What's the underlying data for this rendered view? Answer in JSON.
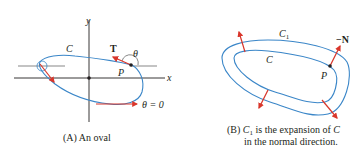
{
  "colors": {
    "curve": "#3a86c8",
    "arrow": "#d9362b",
    "axis": "#231f20",
    "text": "#231f20",
    "background": "#ffffff"
  },
  "panel_a": {
    "caption": "(A) An oval",
    "labels": {
      "y_axis": "y",
      "x_axis": "x",
      "curve": "C",
      "tangent": "T",
      "angle": "θ",
      "point": "P",
      "theta_zero": "θ = 0"
    }
  },
  "panel_b": {
    "caption_line1_prefix": "(B) ",
    "caption_c1": "C",
    "caption_c1_sub": "1",
    "caption_line1_suffix": " is the expansion of ",
    "caption_c": "C",
    "caption_line2": "in the normal direction.",
    "labels": {
      "outer_curve": "C",
      "outer_curve_sub": "1",
      "inner_curve": "C",
      "point": "P",
      "normal": "−N"
    }
  }
}
